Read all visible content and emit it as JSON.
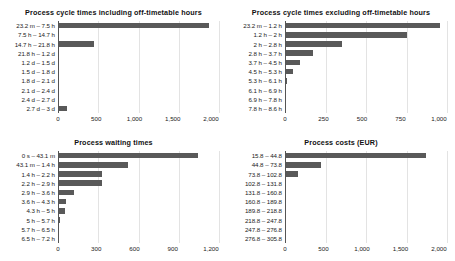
{
  "figure": {
    "background": "#ffffff",
    "bar_color": "#595959",
    "gridline_color": "#e3e3e3",
    "axis_color": "#555555"
  },
  "charts": [
    {
      "id": "process-cycle-times-including",
      "title": "Process cycle times including off-timetable hours",
      "type": "bar",
      "orientation": "horizontal",
      "categories": [
        "23.2 m – 7.5 h",
        "7.5 h – 14.7 h",
        "14.7 h – 21.8 h",
        "21.8 h – 1.2 d",
        "1.2 d – 1.5 d",
        "1.5 d – 1.8 d",
        "1.8 d – 2.1 d",
        "2.1 d – 2.4 d",
        "2.4 d – 2.7 d",
        "2.7 d – 3 d"
      ],
      "values": [
        1870,
        0,
        450,
        0,
        0,
        0,
        0,
        0,
        0,
        110
      ],
      "xlabel": "",
      "ylabel": "",
      "xlim": [
        0,
        2000
      ],
      "xticks": [
        0,
        500,
        1000,
        1500,
        2000
      ],
      "xtick_labels": [
        "0",
        "500",
        "1,000",
        "1,500",
        "2,000"
      ],
      "grid": true
    },
    {
      "id": "process-cycle-times-excluding",
      "title": "Process cycle times excluding off-timetable hours",
      "type": "bar",
      "orientation": "horizontal",
      "categories": [
        "23.2 m – 1.2 h",
        "1.2 h – 2 h",
        "2 h – 2.8 h",
        "2.8 h – 3.7 h",
        "3.7 h – 4.5 h",
        "4.5 h – 5.3 h",
        "5.3 h – 6.1 h",
        "6.1 h – 6.9 h",
        "6.9 h – 7.8 h",
        "7.8 h – 8.6 h"
      ],
      "values": [
        955,
        755,
        350,
        170,
        92,
        48,
        13,
        0,
        0,
        0
      ],
      "xlabel": "",
      "ylabel": "",
      "xlim": [
        0,
        1000
      ],
      "xticks": [
        0,
        250,
        500,
        750,
        1000
      ],
      "xtick_labels": [
        "0",
        "250",
        "500",
        "750",
        "1,000"
      ],
      "grid": true
    },
    {
      "id": "process-waiting-times",
      "title": "Process waiting times",
      "type": "bar",
      "orientation": "horizontal",
      "categories": [
        "0 s – 43.1 m",
        "43.1 m – 1.4 h",
        "1.4 h – 2.2 h",
        "2.2 h – 2.9 h",
        "2.9 h – 3.6 h",
        "3.6 h – 4.3 h",
        "4.3 h – 5 h",
        "5 h – 5.7 h",
        "5.7 h – 6.5 h",
        "6.5 h – 7.2 h"
      ],
      "values": [
        1045,
        525,
        330,
        330,
        118,
        63,
        55,
        18,
        0,
        0
      ],
      "xlabel": "",
      "ylabel": "",
      "xlim": [
        0,
        1200
      ],
      "xticks": [
        0,
        300,
        600,
        900,
        1200
      ],
      "xtick_labels": [
        "0",
        "300",
        "600",
        "900",
        "1,200"
      ],
      "grid": true
    },
    {
      "id": "process-costs-eur",
      "title": "Process costs (EUR)",
      "type": "bar",
      "orientation": "horizontal",
      "categories": [
        "15.8 – 44.8",
        "44.8 – 73.8",
        "73.8 – 102.8",
        "102.8 – 131.8",
        "131.8 – 160.8",
        "160.8 – 189.8",
        "189.8 – 218.8",
        "218.8 – 247.8",
        "247.8 – 276.8",
        "276.8 – 305.8"
      ],
      "values": [
        1740,
        440,
        155,
        0,
        0,
        0,
        0,
        0,
        0,
        0
      ],
      "xlabel": "",
      "ylabel": "",
      "xlim": [
        0,
        2000
      ],
      "xticks": [
        0,
        500,
        1000,
        1500,
        2000
      ],
      "xtick_labels": [
        "0",
        "500",
        "1,000",
        "1,500",
        "2,000"
      ],
      "grid": true
    }
  ],
  "chart_data": [
    {
      "type": "bar",
      "title": "Process cycle times including off-timetable hours",
      "categories": [
        "23.2 m – 7.5 h",
        "7.5 h – 14.7 h",
        "14.7 h – 21.8 h",
        "21.8 h – 1.2 d",
        "1.2 d – 1.5 d",
        "1.5 d – 1.8 d",
        "1.8 d – 2.1 d",
        "2.1 d – 2.4 d",
        "2.4 d – 2.7 d",
        "2.7 d – 3 d"
      ],
      "values": [
        1870,
        0,
        450,
        0,
        0,
        0,
        0,
        0,
        0,
        110
      ],
      "xlabel": "",
      "ylabel": "",
      "xlim": [
        0,
        2000
      ],
      "grid": true,
      "legend": "none"
    },
    {
      "type": "bar",
      "title": "Process cycle times excluding off-timetable hours",
      "categories": [
        "23.2 m – 1.2 h",
        "1.2 h – 2 h",
        "2 h – 2.8 h",
        "2.8 h – 3.7 h",
        "3.7 h – 4.5 h",
        "4.5 h – 5.3 h",
        "5.3 h – 6.1 h",
        "6.1 h – 6.9 h",
        "6.9 h – 7.8 h",
        "7.8 h – 8.6 h"
      ],
      "values": [
        955,
        755,
        350,
        170,
        92,
        48,
        13,
        0,
        0,
        0
      ],
      "xlabel": "",
      "ylabel": "",
      "xlim": [
        0,
        1000
      ],
      "grid": true,
      "legend": "none"
    },
    {
      "type": "bar",
      "title": "Process waiting times",
      "categories": [
        "0 s – 43.1 m",
        "43.1 m – 1.4 h",
        "1.4 h – 2.2 h",
        "2.2 h – 2.9 h",
        "2.9 h – 3.6 h",
        "3.6 h – 4.3 h",
        "4.3 h – 5 h",
        "5 h – 5.7 h",
        "5.7 h – 6.5 h",
        "6.5 h – 7.2 h"
      ],
      "values": [
        1045,
        525,
        330,
        330,
        118,
        63,
        55,
        18,
        0,
        0
      ],
      "xlabel": "",
      "ylabel": "",
      "xlim": [
        0,
        1200
      ],
      "grid": true,
      "legend": "none"
    },
    {
      "type": "bar",
      "title": "Process costs (EUR)",
      "categories": [
        "15.8 – 44.8",
        "44.8 – 73.8",
        "73.8 – 102.8",
        "102.8 – 131.8",
        "131.8 – 160.8",
        "160.8 – 189.8",
        "189.8 – 218.8",
        "218.8 – 247.8",
        "247.8 – 276.8",
        "276.8 – 305.8"
      ],
      "values": [
        1740,
        440,
        155,
        0,
        0,
        0,
        0,
        0,
        0,
        0
      ],
      "xlabel": "",
      "ylabel": "",
      "xlim": [
        0,
        2000
      ],
      "grid": true,
      "legend": "none"
    }
  ]
}
